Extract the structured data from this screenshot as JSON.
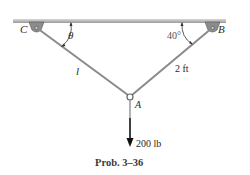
{
  "diagram": {
    "points": {
      "C": "C",
      "B": "B",
      "A": "A"
    },
    "angles": {
      "theta": "θ",
      "right": "40°"
    },
    "lengths": {
      "left": "l",
      "right": "2 ft"
    },
    "load": "200 lb",
    "caption": "Prob. 3–36"
  },
  "colors": {
    "ceiling": "#b8b8b8",
    "cable": "#8a8a8a",
    "support": "#7a7a7a",
    "arrow": "#111111"
  }
}
